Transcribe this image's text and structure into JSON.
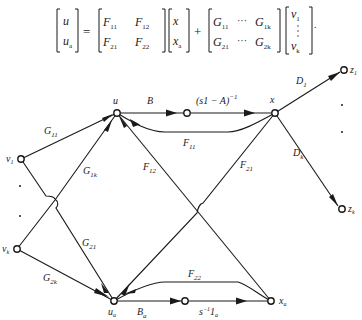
{
  "equation": {
    "lhs": [
      "u",
      "u_a"
    ],
    "F_matrix": [
      [
        "F11",
        "F12"
      ],
      [
        "F21",
        "F22"
      ]
    ],
    "state_vector": [
      "x",
      "x_a"
    ],
    "G_matrix": [
      [
        "G11 ··· G1k"
      ],
      [
        "G21 ··· G2k"
      ]
    ],
    "input_vector": [
      "v1",
      "⋮",
      "vk"
    ],
    "operators": [
      "=",
      "+"
    ],
    "terminator": "."
  },
  "diagram": {
    "nodes": [
      {
        "id": "u",
        "label": "u"
      },
      {
        "id": "b_out",
        "label": ""
      },
      {
        "id": "x",
        "label": "x"
      },
      {
        "id": "z1",
        "label": "z1"
      },
      {
        "id": "zk",
        "label": "zk"
      },
      {
        "id": "v1",
        "label": "v1"
      },
      {
        "id": "vk",
        "label": "vk"
      },
      {
        "id": "ua",
        "label": "ua"
      },
      {
        "id": "ba_out",
        "label": ""
      },
      {
        "id": "xa",
        "label": "xa"
      }
    ],
    "edges": [
      {
        "from": "u",
        "to": "b_out",
        "label": "B"
      },
      {
        "from": "b_out",
        "to": "x",
        "label": "(s1 − A)⁻¹"
      },
      {
        "from": "x",
        "to": "u",
        "label": "F11"
      },
      {
        "from": "xa",
        "to": "u",
        "label": "F12"
      },
      {
        "from": "x",
        "to": "ua",
        "label": "F21"
      },
      {
        "from": "xa",
        "to": "ua",
        "label": "F22"
      },
      {
        "from": "x",
        "to": "z1",
        "label": "D1"
      },
      {
        "from": "x",
        "to": "zk",
        "label": "Dk"
      },
      {
        "from": "v1",
        "to": "u",
        "label": "G11"
      },
      {
        "from": "vk",
        "to": "u",
        "label": "G1k"
      },
      {
        "from": "v1",
        "to": "ua",
        "label": "G21"
      },
      {
        "from": "vk",
        "to": "ua",
        "label": "G2k"
      },
      {
        "from": "ua",
        "to": "ba_out",
        "label": "Ba"
      },
      {
        "from": "ba_out",
        "to": "xa",
        "label": "s⁻¹1a"
      }
    ],
    "ellipsis_dots": [
      "inputs",
      "outputs"
    ]
  }
}
